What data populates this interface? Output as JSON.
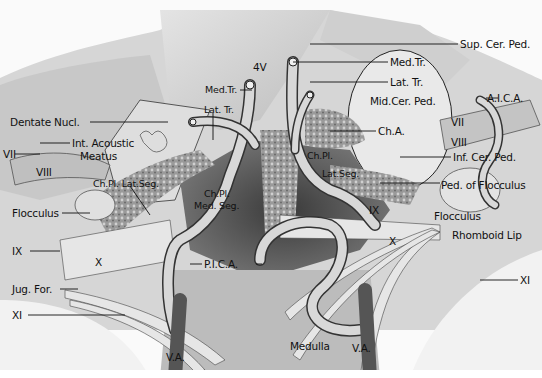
{
  "figure": {
    "labels": [
      {
        "id": "sup-cer-ped",
        "text": "Sup. Cer. Ped.",
        "x": 460,
        "y": 39
      },
      {
        "id": "med-tr-right",
        "text": "Med.Tr.",
        "x": 390,
        "y": 57
      },
      {
        "id": "4v",
        "text": "4V",
        "x": 253,
        "y": 62
      },
      {
        "id": "lat-tr-right",
        "text": "Lat. Tr.",
        "x": 390,
        "y": 76
      },
      {
        "id": "med-tr-left",
        "text": "Med.Tr.",
        "x": 205,
        "y": 85
      },
      {
        "id": "mid-cer-ped",
        "text": "Mid.Cer. Ped.",
        "x": 370,
        "y": 96
      },
      {
        "id": "aica",
        "text": "A.I.C.A.",
        "x": 487,
        "y": 93
      },
      {
        "id": "lat-tr-left",
        "text": "Lat. Tr.",
        "x": 204,
        "y": 105
      },
      {
        "id": "dentate-nucl",
        "text": "Dentate Nucl.",
        "x": 10,
        "y": 117
      },
      {
        "id": "vii-right",
        "text": "VII",
        "x": 451,
        "y": 117
      },
      {
        "id": "ch-a",
        "text": "Ch.A.",
        "x": 378,
        "y": 126
      },
      {
        "id": "int-acoustic-meatus-1",
        "text": "Int. Acoustic",
        "x": 72,
        "y": 138
      },
      {
        "id": "viii-right",
        "text": "VIII",
        "x": 451,
        "y": 137
      },
      {
        "id": "vii-left",
        "text": "VII",
        "x": 3,
        "y": 150
      },
      {
        "id": "int-acoustic-meatus-2",
        "text": "Meatus",
        "x": 80,
        "y": 151
      },
      {
        "id": "ch-pl-right",
        "text": "Ch.Pl.",
        "x": 307,
        "y": 151
      },
      {
        "id": "inf-cer-ped",
        "text": "Inf. Cer. Ped.",
        "x": 453,
        "y": 152
      },
      {
        "id": "lat-seg-right",
        "text": "Lat.Seg.",
        "x": 322,
        "y": 169
      },
      {
        "id": "viii-left",
        "text": "VIII",
        "x": 36,
        "y": 168
      },
      {
        "id": "ch-pl-lat-seg",
        "text": "Ch.Pl. Lat.Seg.",
        "x": 93,
        "y": 180
      },
      {
        "id": "ped-of-flocculus",
        "text": "Ped. of Flocculus",
        "x": 441,
        "y": 180
      },
      {
        "id": "ch-pl-med-seg-1",
        "text": "Ch.Pl.",
        "x": 204,
        "y": 189
      },
      {
        "id": "ix-right",
        "text": "IX",
        "x": 369,
        "y": 205
      },
      {
        "id": "ch-pl-med-seg-2",
        "text": "Med. Seg.",
        "x": 194,
        "y": 201
      },
      {
        "id": "flocculus-left",
        "text": "Flocculus",
        "x": 12,
        "y": 209
      },
      {
        "id": "flocculus-right",
        "text": "Flocculus",
        "x": 434,
        "y": 211
      },
      {
        "id": "rhomboid-lip",
        "text": "Rhomboid Lip",
        "x": 452,
        "y": 230
      },
      {
        "id": "x-right",
        "text": "X",
        "x": 389,
        "y": 236
      },
      {
        "id": "ix-left",
        "text": "IX",
        "x": 12,
        "y": 246
      },
      {
        "id": "x-left",
        "text": "X",
        "x": 95,
        "y": 257
      },
      {
        "id": "pica",
        "text": "P.I.C.A.",
        "x": 204,
        "y": 259
      },
      {
        "id": "xi-right",
        "text": "XI",
        "x": 520,
        "y": 275
      },
      {
        "id": "jug-for",
        "text": "Jug. For.",
        "x": 12,
        "y": 284
      },
      {
        "id": "xi-left",
        "text": "XI",
        "x": 12,
        "y": 310
      },
      {
        "id": "medulla",
        "text": "Medulla",
        "x": 290,
        "y": 341
      },
      {
        "id": "va-left",
        "text": "V.A.",
        "x": 166,
        "y": 352
      },
      {
        "id": "va-right",
        "text": "V.A.",
        "x": 352,
        "y": 343
      }
    ]
  }
}
